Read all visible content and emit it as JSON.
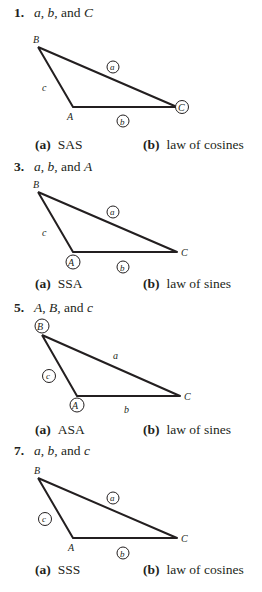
{
  "problems": [
    {
      "number": "1.",
      "given": [
        "a",
        "b",
        "C"
      ],
      "given_text": {
        "p1": "a",
        "sep1": ", ",
        "p2": "b",
        "sep2": ", and ",
        "p3": "C"
      },
      "circled": [
        "a",
        "b",
        "C"
      ],
      "vertex_labels": {
        "A": "A",
        "B": "B",
        "C": "C"
      },
      "side_labels": {
        "a": "a",
        "b": "b",
        "c": "c"
      },
      "answer_a_label": "(a)",
      "answer_a": "SAS",
      "answer_b_label": "(b)",
      "answer_b": "law of cosines"
    },
    {
      "number": "3.",
      "given_text": {
        "p1": "a",
        "sep1": ", ",
        "p2": "b",
        "sep2": ", and ",
        "p3": "A"
      },
      "circled": [
        "a",
        "b",
        "A"
      ],
      "vertex_labels": {
        "A": "A",
        "B": "B",
        "C": "C"
      },
      "side_labels": {
        "a": "a",
        "b": "b",
        "c": "c"
      },
      "answer_a_label": "(a)",
      "answer_a": "SSA",
      "answer_b_label": "(b)",
      "answer_b": "law of sines"
    },
    {
      "number": "5.",
      "given_text": {
        "p1": "A",
        "sep1": ", ",
        "p2": "B",
        "sep2": ", and ",
        "p3": "c"
      },
      "circled": [
        "A",
        "B",
        "c"
      ],
      "vertex_labels": {
        "A": "A",
        "B": "B",
        "C": "C"
      },
      "side_labels": {
        "a": "a",
        "b": "b",
        "c": "c"
      },
      "answer_a_label": "(a)",
      "answer_a": "ASA",
      "answer_b_label": "(b)",
      "answer_b": "law of sines"
    },
    {
      "number": "7.",
      "given_text": {
        "p1": "a",
        "sep1": ", ",
        "p2": "b",
        "sep2": ", and ",
        "p3": "c"
      },
      "circled": [
        "a",
        "b",
        "c"
      ],
      "vertex_labels": {
        "A": "A",
        "B": "B",
        "C": "C"
      },
      "side_labels": {
        "a": "a",
        "b": "b",
        "c": "c"
      },
      "answer_a_label": "(a)",
      "answer_a": "SSS",
      "answer_b_label": "(b)",
      "answer_b": "law of cosines"
    }
  ]
}
